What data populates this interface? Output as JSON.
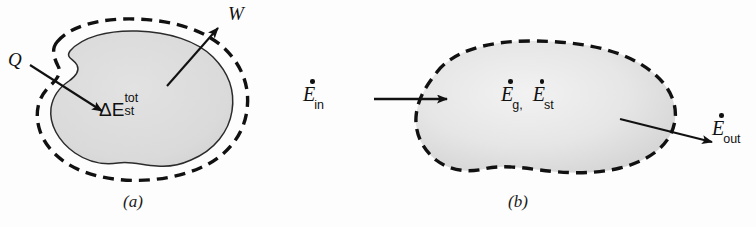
{
  "figure": {
    "background_color": "#fdfdfd",
    "ink_color": "#111111",
    "panel_a": {
      "caption": "(a)",
      "system_fill_color": "#dcdcdc",
      "boundary_style": "dashed",
      "inner_surface_style": "solid",
      "labels": {
        "heat_in": "Q",
        "work_out": "W",
        "storage_delta": "ΔE",
        "storage_superscript": "tot",
        "storage_subscript": "st"
      },
      "arrows": [
        {
          "name": "heat-in-arrow",
          "label": "Q",
          "direction": "into-system"
        },
        {
          "name": "work-out-arrow",
          "label": "W",
          "direction": "out-of-system"
        }
      ]
    },
    "panel_b": {
      "caption": "(b)",
      "system_fill_color": "#e6e6e6",
      "boundary_style": "dashed",
      "labels": {
        "energy_in": "E",
        "energy_in_subscript": "in",
        "energy_generated": "E",
        "energy_generated_subscript": "g",
        "comma": ",",
        "energy_stored": "E",
        "energy_stored_subscript": "st",
        "energy_out": "E",
        "energy_out_subscript": "out"
      },
      "arrows": [
        {
          "name": "energy-in-arrow",
          "label": "E_in",
          "direction": "into-system"
        },
        {
          "name": "energy-out-arrow",
          "label": "E_out",
          "direction": "out-of-system"
        }
      ]
    }
  }
}
